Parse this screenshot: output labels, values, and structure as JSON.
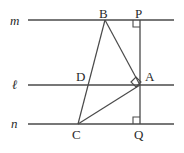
{
  "figure": {
    "type": "geometry-diagram",
    "stroke_color": "#4a4a4a",
    "text_color": "#2a2a2a",
    "background": "#ffffff",
    "line_labels": [
      {
        "name": "line-label-m",
        "text": "m",
        "x": 10,
        "y": 14
      },
      {
        "name": "line-label-l",
        "text": "ℓ",
        "x": 12,
        "y": 78
      },
      {
        "name": "line-label-n",
        "text": "n",
        "x": 11,
        "y": 117
      }
    ],
    "point_labels": [
      {
        "name": "point-label-B",
        "text": "B",
        "x": 99,
        "y": 7
      },
      {
        "name": "point-label-P",
        "text": "P",
        "x": 135,
        "y": 7
      },
      {
        "name": "point-label-D",
        "text": "D",
        "x": 76,
        "y": 70
      },
      {
        "name": "point-label-A",
        "text": "A",
        "x": 145,
        "y": 70
      },
      {
        "name": "point-label-C",
        "text": "C",
        "x": 72,
        "y": 128
      },
      {
        "name": "point-label-Q",
        "text": "Q",
        "x": 134,
        "y": 128
      }
    ],
    "parallel_lines": [
      {
        "name": "line-m",
        "x1": 28,
        "y1": 20,
        "x2": 174,
        "y2": 20
      },
      {
        "name": "line-l",
        "x1": 28,
        "y1": 85,
        "x2": 174,
        "y2": 85
      },
      {
        "name": "line-n",
        "x1": 28,
        "y1": 124,
        "x2": 174,
        "y2": 124
      }
    ],
    "segments": [
      {
        "name": "segment-PQ",
        "x1": 140,
        "y1": 20,
        "x2": 140,
        "y2": 124
      },
      {
        "name": "segment-BC",
        "x1": 105,
        "y1": 20,
        "x2": 78,
        "y2": 124
      },
      {
        "name": "segment-BA",
        "x1": 105,
        "y1": 20,
        "x2": 140,
        "y2": 85
      },
      {
        "name": "segment-CA",
        "x1": 78,
        "y1": 124,
        "x2": 140,
        "y2": 85
      }
    ],
    "right_angle_marks": [
      {
        "name": "right-angle-mark-P",
        "points": "133,20 133,27 140,27"
      },
      {
        "name": "right-angle-mark-Q",
        "points": "133,124 133,117 140,117"
      },
      {
        "name": "right-angle-mark-A",
        "points": "131,82 136,77 141,82 136,87"
      }
    ]
  }
}
